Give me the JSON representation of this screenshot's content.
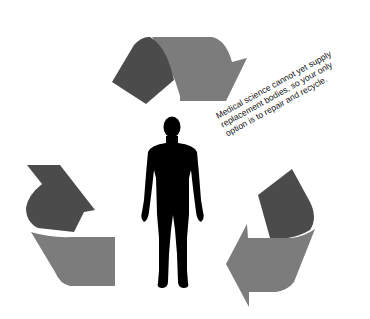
{
  "caption": {
    "lines": [
      "Medical science cannot yet supply",
      "replacement bodies, so your only",
      "option is to repair and recycle."
    ]
  },
  "colors": {
    "background": "#ffffff",
    "arrow_dark": "#4b4b4b",
    "arrow_light": "#7c7c7c",
    "figure": "#000000"
  },
  "diagram": {
    "type": "recycle-cycle",
    "elements": [
      "top-arrow",
      "right-arrow",
      "left-arrow",
      "human-silhouette",
      "caption"
    ]
  }
}
